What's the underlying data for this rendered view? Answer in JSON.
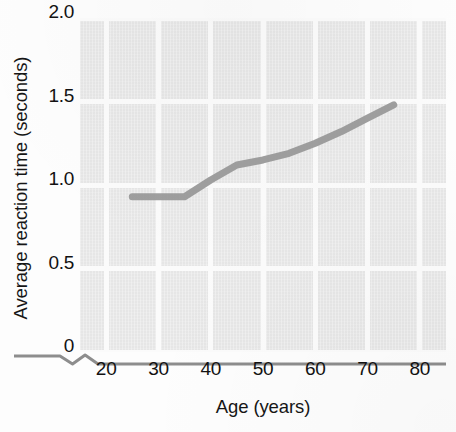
{
  "chart_data": {
    "type": "line",
    "title": "",
    "subtitle": "",
    "xlabel": "Age (years)",
    "ylabel": "Average reaction time (seconds)",
    "xlim": [
      15,
      85
    ],
    "ylim": [
      0,
      2.0
    ],
    "xticks": [
      20,
      30,
      40,
      50,
      60,
      70,
      80
    ],
    "xtick_labels": [
      "20",
      "30",
      "40",
      "50",
      "60",
      "70",
      "80"
    ],
    "yticks": [
      0,
      0.5,
      1.0,
      1.5,
      2.0
    ],
    "ytick_labels": [
      "0",
      "0.5",
      "1.0",
      "1.5",
      "2.0"
    ],
    "grid": true,
    "grid_color": "#fbfbfb",
    "plot_background": "#e6e6e6",
    "axis_break": true,
    "legend": null,
    "annotations": [],
    "series": [
      {
        "name": "Average reaction time",
        "color": "#9a9a9a",
        "line_width": 7,
        "x": [
          25,
          30,
          35,
          40,
          45,
          50,
          55,
          60,
          65,
          70,
          75
        ],
        "values": [
          0.93,
          0.93,
          0.93,
          1.03,
          1.12,
          1.15,
          1.19,
          1.25,
          1.32,
          1.4,
          1.48
        ]
      }
    ]
  },
  "axis_titles": {
    "x": "Age (years)",
    "y": "Average reaction time (seconds)"
  }
}
